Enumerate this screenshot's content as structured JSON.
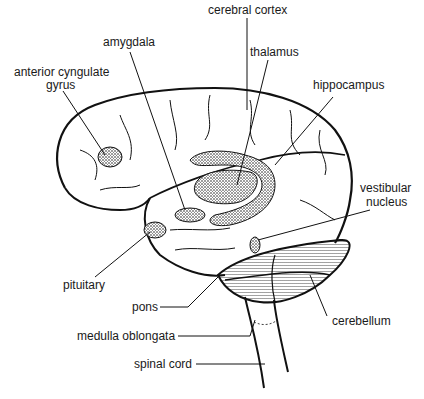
{
  "labels": {
    "cerebral_cortex": "cerebral cortex",
    "amygdala": "amygdala",
    "thalamus": "thalamus",
    "anterior_cyngulate_line1": "anterior cyngulate",
    "anterior_cyngulate_line2": "gyrus",
    "hippocampus": "hippocampus",
    "vestibular_line1": "vestibular",
    "vestibular_line2": "nucleus",
    "pituitary": "pituitary",
    "pons": "pons",
    "medulla_oblongata": "medulla oblongata",
    "cerebellum": "cerebellum",
    "spinal_cord": "spinal cord"
  },
  "colors": {
    "ink": "#1a1a1a",
    "background": "#ffffff"
  }
}
